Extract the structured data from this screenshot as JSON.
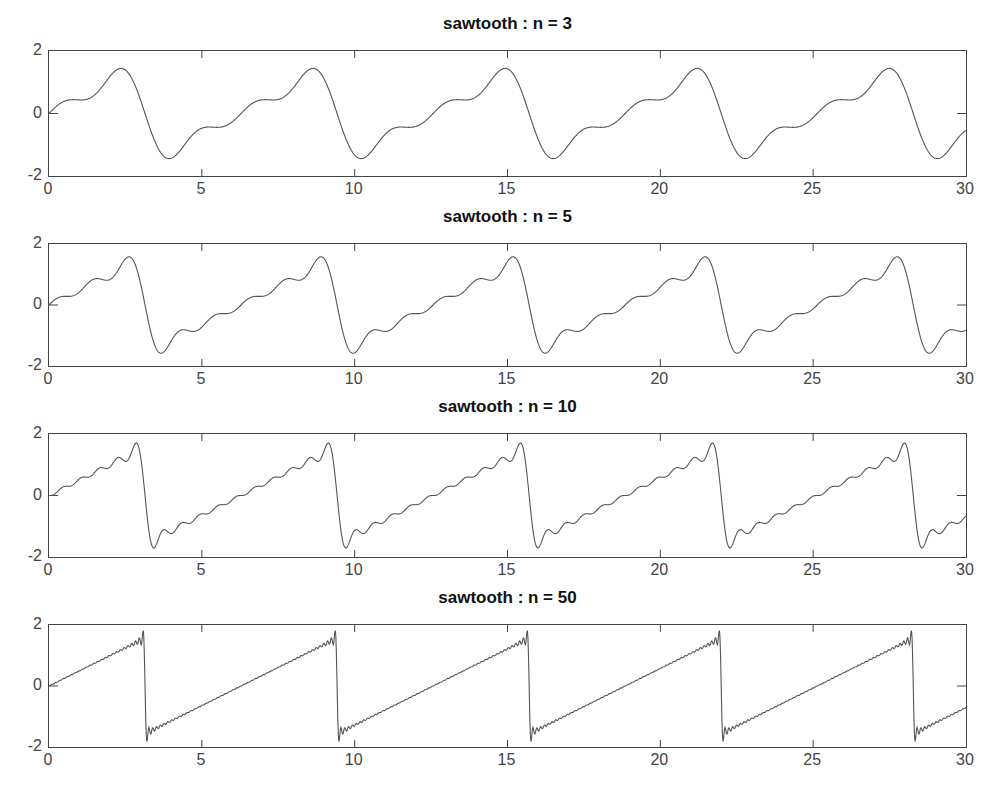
{
  "figure": {
    "width": 1000,
    "height": 798,
    "line_color": "#555555",
    "axis_color": "#444444"
  },
  "chart_data": [
    {
      "type": "line",
      "title": "sawtooth : n = 3",
      "n_terms": 3,
      "formula": "sum_{k=1..n} (-1)^(k+1) * sin(k*x)/k",
      "xlabel": "",
      "ylabel": "",
      "xlim": [
        0,
        30
      ],
      "ylim": [
        -2,
        2
      ],
      "xticks": [
        0,
        5,
        10,
        15,
        20,
        25,
        30
      ],
      "yticks": [
        -2,
        0,
        2
      ],
      "grid": false,
      "key_points": {
        "max": 1.44,
        "max_x": 2.3,
        "min": -1.44,
        "min_x": 3.98
      }
    },
    {
      "type": "line",
      "title": "sawtooth : n = 5",
      "n_terms": 5,
      "formula": "sum_{k=1..n} (-1)^(k+1) * sin(k*x)/k",
      "xlabel": "",
      "ylabel": "",
      "xlim": [
        0,
        30
      ],
      "ylim": [
        -2,
        2
      ],
      "xticks": [
        0,
        5,
        10,
        15,
        20,
        25,
        30
      ],
      "yticks": [
        -2,
        0,
        2
      ],
      "grid": false,
      "key_points": {
        "max": 1.58,
        "max_x": 2.6,
        "min": -1.58,
        "min_x": 3.68
      }
    },
    {
      "type": "line",
      "title": "sawtooth : n = 10",
      "n_terms": 10,
      "formula": "sum_{k=1..n} (-1)^(k+1) * sin(k*x)/k",
      "xlabel": "",
      "ylabel": "",
      "xlim": [
        0,
        30
      ],
      "ylim": [
        -2,
        2
      ],
      "xticks": [
        0,
        5,
        10,
        15,
        20,
        25,
        30
      ],
      "yticks": [
        -2,
        0,
        2
      ],
      "grid": false,
      "key_points": {
        "max": 1.67,
        "max_x": 2.85,
        "min": -1.67,
        "min_x": 3.43
      }
    },
    {
      "type": "line",
      "title": "sawtooth : n = 50",
      "n_terms": 50,
      "formula": "sum_{k=1..n} (-1)^(k+1) * sin(k*x)/k",
      "xlabel": "",
      "ylabel": "",
      "xlim": [
        0,
        30
      ],
      "ylim": [
        -2,
        2
      ],
      "xticks": [
        0,
        5,
        10,
        15,
        20,
        25,
        30
      ],
      "yticks": [
        -2,
        0,
        2
      ],
      "grid": false,
      "key_points": {
        "max": 1.85,
        "max_x": 3.08,
        "min": -1.85,
        "min_x": 3.2
      }
    }
  ],
  "layout": {
    "panels": [
      {
        "axes_top": 50,
        "axes_bottom": 177,
        "title_top": 14
      },
      {
        "axes_top": 243,
        "axes_bottom": 367,
        "title_top": 207
      },
      {
        "axes_top": 433,
        "axes_bottom": 558,
        "title_top": 397
      },
      {
        "axes_top": 624,
        "axes_bottom": 748,
        "title_top": 588
      }
    ],
    "axes_left": 48,
    "axes_right": 967
  }
}
